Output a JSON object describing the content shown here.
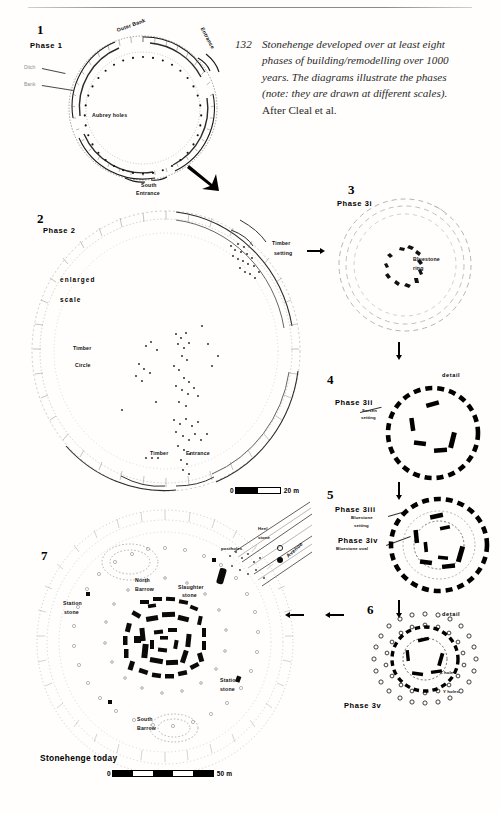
{
  "page": {
    "header_ghost_left": "",
    "header_ghost_right": ""
  },
  "caption": {
    "number": "132",
    "line1": "Stonehenge developed over at least eight",
    "line2": "phases of building/remodelling over 1000",
    "line3": "years. The diagrams illustrate the phases",
    "line4": "(note: they are drawn at different scales).",
    "line5": "After Cleal et al."
  },
  "figures": [
    {
      "number": "1",
      "phase": "Phase 1",
      "labels": {
        "ditch": "Ditch",
        "bank": "Bank",
        "outer_bank": "Outer Bank",
        "entrance": "Entrance",
        "aubrey": "Aubrey  holes",
        "south": "South",
        "south2": "Entrance"
      }
    },
    {
      "number": "2",
      "phase": "Phase 2",
      "labels": {
        "enlarged": "enlarged",
        "scale": "scale",
        "timber": "Timber",
        "circle": "Circle",
        "timber_setting1": "Timber",
        "timber_setting2": "setting",
        "timber_entrance1": "Timber",
        "timber_entrance2": "Entrance"
      },
      "scale": {
        "zero": "0",
        "value": "20 m"
      }
    },
    {
      "number": "3",
      "phase": "Phase 3i",
      "labels": {
        "bluestone1": "Bluestone",
        "bluestone2": "ring"
      }
    },
    {
      "number": "4",
      "phase": "Phase 3ii",
      "detail": "detail",
      "labels": {
        "sarsen1": "Sarsen",
        "sarsen2": "setting"
      }
    },
    {
      "number": "5",
      "phase_a": "Phase 3iii",
      "phase_b": "Phase 3iv",
      "labels": {
        "bluestone_setting1": "Bluestone",
        "bluestone_setting2": "setting",
        "bluestone_oval": "Bluestone oval"
      }
    },
    {
      "number": "6",
      "phase": "Phase 3v",
      "detail": "detail",
      "labels": {
        "z_holes": "Z holes",
        "y_holes": "Y holes"
      }
    },
    {
      "number": "7",
      "title": "Stonehenge today",
      "labels": {
        "north_barrow1": "North",
        "north_barrow2": "Barrow",
        "south_barrow1": "South",
        "south_barrow2": "Barrow",
        "station_stone1": "Station",
        "station_stone2": "stone",
        "station_stone3": "Station",
        "station_stone4": "stone",
        "slaughter1": "Slaughter",
        "slaughter2": "stone",
        "heel1": "Heel",
        "heel2": "stone",
        "postholes": "postholes",
        "avenue": "Avenue"
      },
      "scale": {
        "zero": "0",
        "value": "50 m"
      }
    }
  ],
  "colors": {
    "ink": "#000000",
    "grey_ink": "#8d8d8d",
    "paper": "#fffefc",
    "leader": "#4a4a4a"
  }
}
